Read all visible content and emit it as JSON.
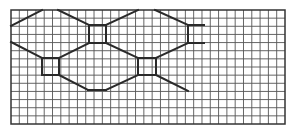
{
  "diagram": {
    "type": "grid-path-diagram",
    "grid": {
      "origin_x": 11,
      "origin_y": 10,
      "width": 274,
      "height": 114,
      "columns": 33,
      "rows": 14,
      "line_color": "#555555",
      "border_color": "#333333"
    },
    "path_color": "#2a2a2a",
    "path_segments": [
      [
        [
          11,
          26
        ],
        [
          42,
          10
        ]
      ],
      [
        [
          58,
          10
        ],
        [
          89,
          25
        ]
      ],
      [
        [
          89,
          25
        ],
        [
          106,
          25
        ]
      ],
      [
        [
          89,
          25
        ],
        [
          89,
          43
        ]
      ],
      [
        [
          106,
          25
        ],
        [
          106,
          43
        ]
      ],
      [
        [
          89,
          43
        ],
        [
          106,
          43
        ]
      ],
      [
        [
          106,
          25
        ],
        [
          138,
          10
        ]
      ],
      [
        [
          155,
          10
        ],
        [
          188,
          25
        ]
      ],
      [
        [
          188,
          25
        ],
        [
          188,
          43
        ]
      ],
      [
        [
          188,
          25
        ],
        [
          204,
          25
        ]
      ],
      [
        [
          188,
          43
        ],
        [
          204,
          43
        ]
      ],
      [
        [
          106,
          43
        ],
        [
          138,
          58
        ]
      ],
      [
        [
          156,
          58
        ],
        [
          188,
          43
        ]
      ],
      [
        [
          89,
          43
        ],
        [
          59,
          58
        ]
      ],
      [
        [
          11,
          42
        ],
        [
          42,
          58
        ]
      ],
      [
        [
          42,
          58
        ],
        [
          59,
          58
        ]
      ],
      [
        [
          42,
          58
        ],
        [
          42,
          75
        ]
      ],
      [
        [
          59,
          58
        ],
        [
          59,
          75
        ]
      ],
      [
        [
          42,
          75
        ],
        [
          59,
          75
        ]
      ],
      [
        [
          59,
          75
        ],
        [
          88,
          90
        ]
      ],
      [
        [
          88,
          90
        ],
        [
          106,
          90
        ]
      ],
      [
        [
          106,
          90
        ],
        [
          138,
          75
        ]
      ],
      [
        [
          138,
          58
        ],
        [
          156,
          58
        ]
      ],
      [
        [
          138,
          58
        ],
        [
          138,
          75
        ]
      ],
      [
        [
          156,
          58
        ],
        [
          156,
          75
        ]
      ],
      [
        [
          138,
          75
        ],
        [
          156,
          75
        ]
      ],
      [
        [
          156,
          75
        ],
        [
          188,
          91
        ]
      ]
    ],
    "squares": [
      {
        "name": "upper-center-square",
        "x": 89,
        "y": 25,
        "w": 17,
        "h": 18
      },
      {
        "name": "left-square",
        "x": 42,
        "y": 58,
        "w": 17,
        "h": 17
      },
      {
        "name": "middle-right-square",
        "x": 138,
        "y": 58,
        "w": 18,
        "h": 17
      }
    ],
    "open_bracket": {
      "name": "upper-right-bracket",
      "x": 188,
      "y": 25,
      "w": 16,
      "h": 18
    }
  }
}
